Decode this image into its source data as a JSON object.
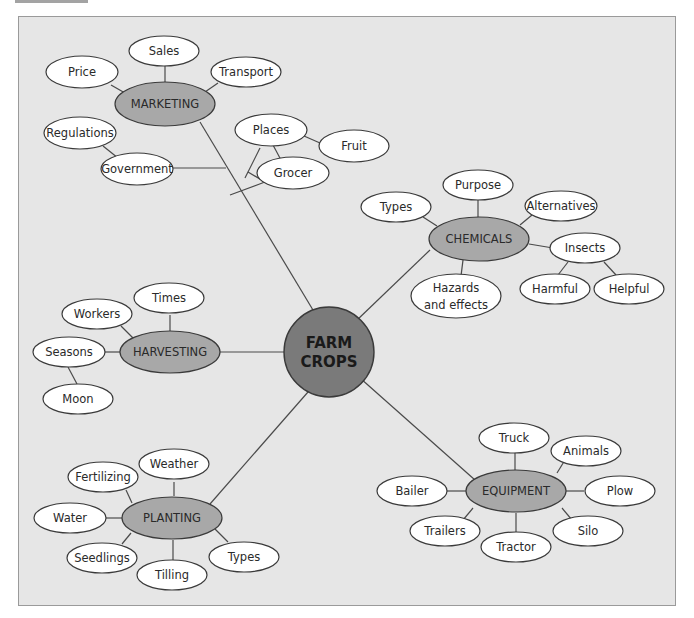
{
  "diagram": {
    "type": "concept-map",
    "root": {
      "label_line1": "FARM",
      "label_line2": "CROPS"
    },
    "categories": {
      "marketing": {
        "label": "MARKETING",
        "children": [
          "Price",
          "Sales",
          "Transport"
        ],
        "sub_branch": {
          "government": {
            "label": "Government",
            "children": [
              "Regulations"
            ]
          },
          "places": {
            "label": "Places",
            "children": [
              "Fruit",
              "Grocer"
            ]
          }
        }
      },
      "chemicals": {
        "label": "CHEMICALS",
        "children": [
          "Types",
          "Purpose",
          "Alternatives",
          "Hazards",
          "and effects"
        ],
        "insects": {
          "label": "Insects",
          "children": [
            "Harmful",
            "Helpful"
          ]
        }
      },
      "harvesting": {
        "label": "HARVESTING",
        "children": [
          "Workers",
          "Times",
          "Seasons",
          "Moon"
        ]
      },
      "planting": {
        "label": "PLANTING",
        "children": [
          "Fertilizing",
          "Weather",
          "Water",
          "Seedlings",
          "Tilling",
          "Types"
        ]
      },
      "equipment": {
        "label": "EQUIPMENT",
        "children": [
          "Truck",
          "Animals",
          "Bailer",
          "Plow",
          "Trailers",
          "Tractor",
          "Silo"
        ]
      }
    },
    "colors": {
      "background": "#e6e6e6",
      "leaf_fill": "#ffffff",
      "category_fill": "#a8a8a8",
      "root_fill": "#7a7a7a",
      "line": "#4a4a4a"
    }
  }
}
